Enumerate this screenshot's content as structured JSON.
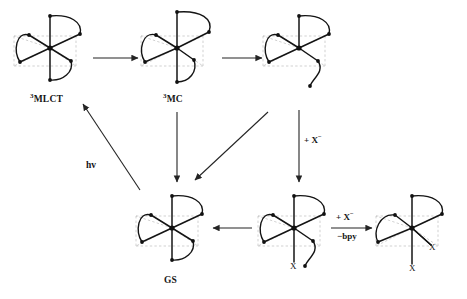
{
  "figure": {
    "type": "reaction-scheme"
  },
  "structures": [
    {
      "id": "mlct",
      "name": "triplet-MLCT-complex",
      "label_pre": "3",
      "label_main": "MLCT",
      "cx": 50,
      "cy": 48,
      "variant": "normal",
      "x_labels": []
    },
    {
      "id": "mc",
      "name": "triplet-MC-complex",
      "label_pre": "3",
      "label_main": "MC",
      "cx": 177,
      "cy": 48,
      "variant": "elongated",
      "x_labels": []
    },
    {
      "id": "dissoc",
      "name": "dissociated-ligand-intermediate",
      "label_pre": "",
      "label_main": "",
      "cx": 299,
      "cy": 48,
      "variant": "dangling",
      "x_labels": []
    },
    {
      "id": "gs",
      "name": "ground-state-complex",
      "label_pre": "",
      "label_main": "GS",
      "cx": 172,
      "cy": 228,
      "variant": "normal",
      "x_labels": []
    },
    {
      "id": "monox",
      "name": "mono-substituted-complex",
      "label_pre": "",
      "label_main": "",
      "cx": 294,
      "cy": 228,
      "variant": "dangling-x",
      "x_labels": [
        "X"
      ]
    },
    {
      "id": "bisx",
      "name": "bis-substituted-complex",
      "label_pre": "",
      "label_main": "",
      "cx": 412,
      "cy": 228,
      "variant": "doublex",
      "x_labels": [
        "X",
        "X"
      ]
    }
  ],
  "labels": {
    "mlct": "MLCT",
    "mlct_superscript": "3",
    "mc": "MC",
    "mc_superscript": "3",
    "gs": "GS",
    "hv": "hv",
    "plus_x_vertical": "+ X",
    "plus_x_vertical_sup": "−",
    "plus_x_horizontal": "+ X",
    "plus_x_horizontal_sup": "−",
    "minus_bpy": "−bpy",
    "x_mono": "X",
    "x_bis_bottom": "X",
    "x_bis_right": "X"
  },
  "arrows": [
    {
      "name": "arrow-mlct-to-mc",
      "from": "mlct",
      "to": "mc",
      "kind": "horizontal"
    },
    {
      "name": "arrow-mc-to-dissoc",
      "from": "mc",
      "to": "dissoc",
      "kind": "horizontal"
    },
    {
      "name": "arrow-mc-to-gs",
      "from": "mc",
      "to": "gs",
      "kind": "vertical"
    },
    {
      "name": "arrow-dissoc-to-gs",
      "from": "dissoc",
      "to": "gs",
      "kind": "diagonal"
    },
    {
      "name": "arrow-gs-to-mlct",
      "from": "gs",
      "to": "mlct",
      "kind": "diagonal-up",
      "label": "hv"
    },
    {
      "name": "arrow-dissoc-to-monox",
      "from": "dissoc",
      "to": "monox",
      "kind": "vertical",
      "label": "+ X−"
    },
    {
      "name": "arrow-monox-to-gs",
      "from": "monox",
      "to": "gs",
      "kind": "horizontal-left"
    },
    {
      "name": "arrow-monox-to-bisx",
      "from": "monox",
      "to": "bisx",
      "kind": "horizontal",
      "label_top": "+ X−",
      "label_bottom": "−bpy"
    }
  ],
  "colors": {
    "line": "#1a1a1a",
    "dashed": "#b8b8b8",
    "arrow": "#2b2b2b",
    "text": "#151515",
    "background": "#ffffff"
  }
}
